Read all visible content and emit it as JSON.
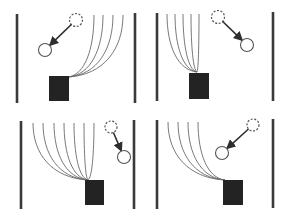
{
  "figure": {
    "width": 289,
    "height": 219,
    "colors": {
      "background": "#ffffff",
      "wall": "#3a3a3a",
      "box": "#232323",
      "curve": "#6a6a6a",
      "arrow": "#2e2e2e",
      "circle": "#555555"
    },
    "panels": [
      {
        "id": "top-left",
        "walls": [
          {
            "x": 17,
            "y1": 14,
            "y2": 103
          },
          {
            "x": 135,
            "y1": 13,
            "y2": 103
          }
        ],
        "box": {
          "x": 49,
          "y": 76,
          "w": 20,
          "h": 25
        },
        "origin": {
          "x": 68,
          "y": 77
        },
        "curve_tops": [
          94,
          103,
          113,
          123
        ],
        "curve_top_y": 15,
        "dashed_circle": {
          "cx": 76,
          "cy": 20,
          "r": 6.5
        },
        "solid_circle": {
          "cx": 45,
          "cy": 50,
          "r": 6.5
        }
      },
      {
        "id": "top-right",
        "walls": [
          {
            "x": 157,
            "y1": 13,
            "y2": 101
          },
          {
            "x": 273,
            "y1": 12,
            "y2": 101
          }
        ],
        "box": {
          "x": 189,
          "y": 73,
          "w": 20,
          "h": 26
        },
        "origin": {
          "x": 197,
          "y": 72
        },
        "curve_tops": [
          167,
          175,
          183,
          191,
          199
        ],
        "curve_top_y": 14,
        "dashed_circle": {
          "cx": 218,
          "cy": 17,
          "r": 6.5
        },
        "solid_circle": {
          "cx": 247,
          "cy": 45,
          "r": 6.5
        }
      },
      {
        "id": "bottom-left",
        "walls": [
          {
            "x": 21,
            "y1": 121,
            "y2": 209
          },
          {
            "x": 134,
            "y1": 120,
            "y2": 209
          }
        ],
        "box": {
          "x": 85,
          "y": 180,
          "w": 19,
          "h": 25
        },
        "origin": {
          "x": 88,
          "y": 180
        },
        "curve_tops": [
          33,
          43,
          54,
          64,
          74,
          84,
          94
        ],
        "curve_top_y": 123,
        "dashed_circle": {
          "cx": 111,
          "cy": 127,
          "r": 6
        },
        "solid_circle": {
          "cx": 124,
          "cy": 157,
          "r": 6.5
        }
      },
      {
        "id": "bottom-right",
        "walls": [
          {
            "x": 157,
            "y1": 120,
            "y2": 209
          },
          {
            "x": 273,
            "y1": 119,
            "y2": 208
          }
        ],
        "box": {
          "x": 223,
          "y": 180,
          "w": 20,
          "h": 25
        },
        "origin": {
          "x": 225,
          "y": 180
        },
        "curve_tops": [
          168,
          178,
          188,
          198
        ],
        "curve_top_y": 122,
        "dashed_circle": {
          "cx": 253,
          "cy": 125,
          "r": 6
        },
        "solid_circle": {
          "cx": 222,
          "cy": 153,
          "r": 6.5
        }
      }
    ]
  }
}
